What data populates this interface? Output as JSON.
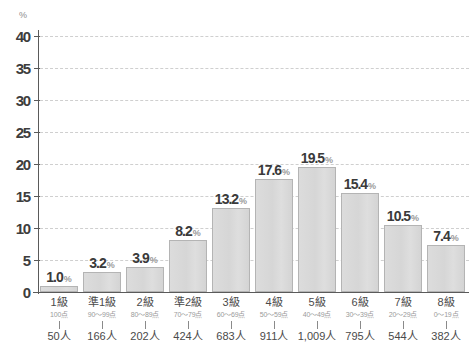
{
  "chart_data": {
    "type": "bar",
    "title": "",
    "xlabel": "",
    "ylabel": "%",
    "ylim": [
      0,
      40
    ],
    "yticks": [
      0,
      5,
      10,
      15,
      20,
      25,
      30,
      35,
      40
    ],
    "grid": true,
    "legend": "none",
    "categories": [
      "1級",
      "準1級",
      "2級",
      "準2級",
      "3級",
      "4級",
      "5級",
      "6級",
      "7級",
      "8級"
    ],
    "values": [
      1.0,
      3.2,
      3.9,
      8.2,
      13.2,
      17.6,
      19.5,
      15.4,
      10.5,
      7.4
    ],
    "value_labels": [
      "1.0",
      "3.2",
      "3.9",
      "8.2",
      "13.2",
      "17.6",
      "19.5",
      "15.4",
      "10.5",
      "7.4"
    ],
    "value_suffix": "%",
    "score_ranges": [
      "100点",
      "90〜99点",
      "80〜89点",
      "70〜79点",
      "60〜69点",
      "50〜59点",
      "40〜49点",
      "30〜39点",
      "20〜29点",
      "0〜19点"
    ],
    "counts": [
      "50人",
      "166人",
      "202人",
      "424人",
      "683人",
      "911人",
      "1,009人",
      "795人",
      "544人",
      "382人"
    ],
    "colors": {
      "bar_fill": "#d8d8d8",
      "bar_border": "#b4b4b4",
      "axis": "#5a5a5a",
      "gridline": "#cfcfcf",
      "value_text": "#3a3a3a",
      "percent_text": "#9a9a9a",
      "tick_text": "#3d3d3d",
      "category_text": "#4a4a4a",
      "score_text": "#9a9a9a",
      "background": "#ffffff"
    }
  }
}
